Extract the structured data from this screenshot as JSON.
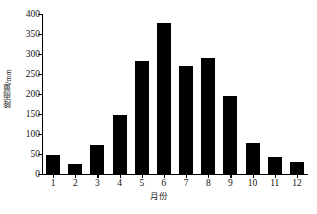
{
  "chart_data": {
    "type": "bar",
    "title": "",
    "subtitle": "",
    "xlabel": "月份",
    "ylabel": "降雨量/mm",
    "categories": [
      "1",
      "2",
      "3",
      "4",
      "5",
      "6",
      "7",
      "8",
      "9",
      "10",
      "11",
      "12"
    ],
    "values": [
      47,
      25,
      72,
      148,
      282,
      377,
      270,
      290,
      196,
      78,
      43,
      31
    ],
    "ylim": [
      0,
      400
    ],
    "yticks": [
      0,
      50,
      100,
      150,
      200,
      250,
      300,
      350,
      400
    ],
    "ytick_labels": [
      "0",
      "50",
      "100",
      "150",
      "200",
      "250",
      "300",
      "350",
      "400"
    ],
    "grid": false,
    "legend": false,
    "legend_position": "none",
    "bar_color": "#000000",
    "axis_color": "#000000",
    "background_color": "#ffffff"
  },
  "footer": {
    "caption": ""
  }
}
